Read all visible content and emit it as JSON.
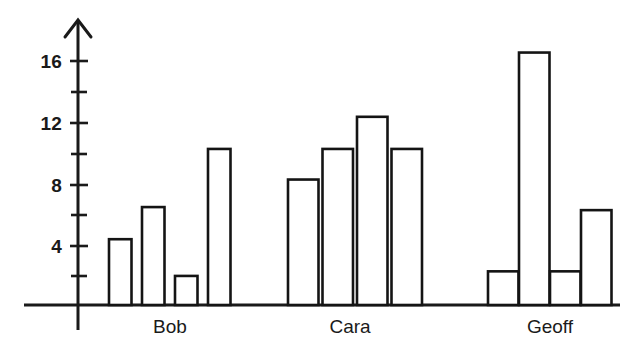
{
  "chart_data": {
    "type": "bar",
    "title": "",
    "subtitle": "",
    "xlabel": "",
    "ylabel": "",
    "categories": [
      "Bob",
      "Cara",
      "Geoff"
    ],
    "series": [
      {
        "name": "Bar 1",
        "values": [
          4.3,
          8.2,
          2.2
        ]
      },
      {
        "name": "Bar 2",
        "values": [
          6.4,
          10.2,
          16.5
        ]
      },
      {
        "name": "Bar 3",
        "values": [
          1.9,
          12.3,
          2.2
        ]
      },
      {
        "name": "Bar 4",
        "values": [
          10.2,
          10.2,
          6.2
        ]
      }
    ],
    "groups": [
      {
        "label": "Bob",
        "values": [
          4.3,
          6.4,
          1.9,
          10.2
        ]
      },
      {
        "label": "Cara",
        "values": [
          8.2,
          10.2,
          12.3,
          10.2
        ]
      },
      {
        "label": "Geoff",
        "values": [
          2.2,
          16.5,
          2.2,
          6.2
        ]
      }
    ],
    "ylim": [
      0,
      18
    ],
    "y_major_ticks": [
      4,
      8,
      12,
      16
    ],
    "y_minor_ticks": [
      2,
      6,
      10,
      14
    ],
    "y_tick_labels": [
      "4",
      "8",
      "12",
      "16"
    ],
    "grid": false,
    "legend": "none",
    "bar_fill": "#ffffff",
    "bar_stroke": "#141414",
    "axis_color": "#1a1a1a",
    "x_axis_arrow": false,
    "y_axis_arrow": true
  },
  "axis": {
    "y_labels": [
      "16",
      "12",
      "8",
      "4"
    ]
  },
  "labels": {
    "group_1": "Bob",
    "group_2": "Cara",
    "group_3": "Geoff"
  }
}
